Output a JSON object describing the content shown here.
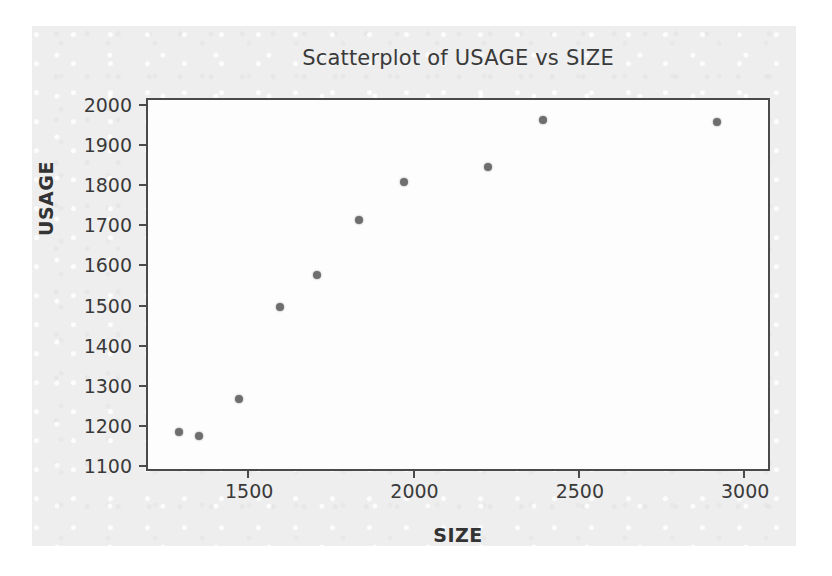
{
  "chart_data": {
    "type": "scatter",
    "title": "Scatterplot of USAGE vs SIZE",
    "xlabel": "SIZE",
    "ylabel": "USAGE",
    "xlim": [
      1200,
      3075
    ],
    "ylim": [
      1090,
      2010
    ],
    "xticks": [
      1500,
      2000,
      2500,
      3000
    ],
    "xtick_labels": [
      "1500",
      "2000",
      "2500",
      "3000"
    ],
    "yticks": [
      1100,
      1200,
      1300,
      1400,
      1500,
      1600,
      1700,
      1800,
      1900,
      2000
    ],
    "ytick_labels": [
      "1100",
      "1200",
      "1300",
      "1400",
      "1500",
      "1600",
      "1700",
      "1800",
      "1900",
      "2000"
    ],
    "grid": false,
    "legend": null,
    "marker": {
      "shape": "circle",
      "color": "#6e6e6e",
      "size_px": 8
    },
    "series": [
      {
        "name": "USAGE vs SIZE",
        "points": [
          {
            "x": 1293,
            "y": 1183
          },
          {
            "x": 1353,
            "y": 1172
          },
          {
            "x": 1475,
            "y": 1265
          },
          {
            "x": 1600,
            "y": 1495
          },
          {
            "x": 1710,
            "y": 1573
          },
          {
            "x": 1838,
            "y": 1712
          },
          {
            "x": 1975,
            "y": 1805
          },
          {
            "x": 2228,
            "y": 1842
          },
          {
            "x": 2395,
            "y": 1960
          },
          {
            "x": 2920,
            "y": 1955
          }
        ]
      }
    ]
  },
  "figure": {
    "background_color": "#eeeeee",
    "plot_background_color": "#fdfdfd",
    "axis_color": "#4a4a4a",
    "text_color": "#3a3a3a"
  }
}
